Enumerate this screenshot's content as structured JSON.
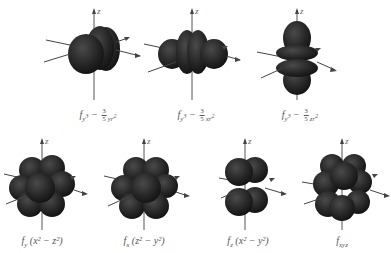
{
  "colors": {
    "lobe_dark": "#161616",
    "lobe_mid": "#2e2e2e",
    "lobe_highlight": "#4a4a4a",
    "axis": "#555555",
    "label_text": "#555555"
  },
  "axis_label": "z",
  "orbitals": [
    {
      "id": "fy3",
      "row": 1,
      "shape": "two-ring-with-front-lobe",
      "label_prefix": "f",
      "label_sub_a": "y",
      "label_sub_a_sup": "3",
      "minus": "−",
      "frac_num": "3",
      "frac_den": "5",
      "label_tail": "yr",
      "label_tail_sup": "2"
    },
    {
      "id": "fx3",
      "row": 1,
      "shape": "two-ring-with-side-lobes",
      "label_prefix": "f",
      "label_sub_a": "y",
      "label_sub_a_sup": "3",
      "minus": "−",
      "frac_num": "3",
      "frac_den": "5",
      "label_tail": "xr",
      "label_tail_sup": "2"
    },
    {
      "id": "fz3",
      "row": 1,
      "shape": "two-ring-with-vertical-lobes",
      "label_prefix": "f",
      "label_sub_a": "y",
      "label_sub_a_sup": "3",
      "minus": "−",
      "frac_num": "3",
      "frac_den": "5",
      "label_tail": "zr",
      "label_tail_sup": "2"
    },
    {
      "id": "fy_z2x2",
      "row": 2,
      "shape": "eight-lobe",
      "label_prefix": "f",
      "label_sub_a": "y",
      "paren": "(x² − z²)"
    },
    {
      "id": "fx_z2y2",
      "row": 2,
      "shape": "eight-lobe",
      "label_prefix": "f",
      "label_sub_a": "x",
      "paren": "(z² − y²)"
    },
    {
      "id": "fz_x2y2",
      "row": 2,
      "shape": "eight-lobe",
      "label_prefix": "f",
      "label_sub_a": "z",
      "paren": "(x² − y²)"
    },
    {
      "id": "fxyz",
      "row": 2,
      "shape": "eight-lobe",
      "label_prefix": "f",
      "label_sub_a": "xyz",
      "paren": ""
    }
  ]
}
